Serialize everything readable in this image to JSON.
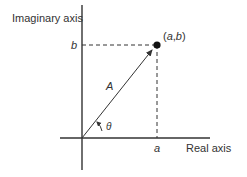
{
  "diagram": {
    "type": "complex-plane-phasor",
    "labels": {
      "y_axis": "Imaginary axis",
      "x_axis": "Real axis",
      "point": "(a,b)",
      "point_open": "(",
      "point_a": "a",
      "point_comma": ",",
      "point_b": "b",
      "point_close": ")",
      "b_tick": "b",
      "a_tick": "a",
      "magnitude": "A",
      "angle": "θ"
    },
    "colors": {
      "line": "#333333",
      "text": "#333333",
      "background": "#ffffff"
    }
  }
}
